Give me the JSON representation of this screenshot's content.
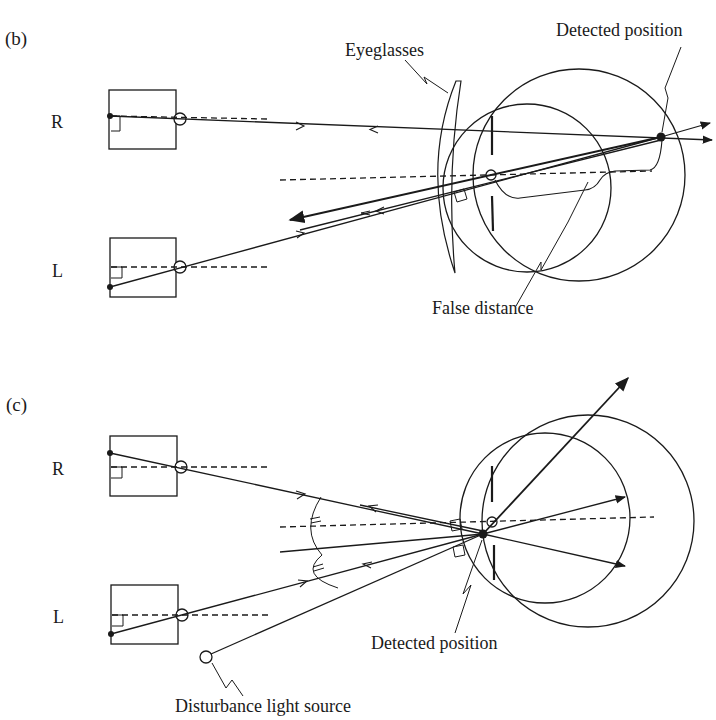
{
  "figure": {
    "panel_b": {
      "label": "(b)",
      "camera_right_label": "R",
      "camera_left_label": "L",
      "annotations": {
        "eyeglasses": "Eyeglasses",
        "detected_position": "Detected position",
        "false_distance": "False distance"
      }
    },
    "panel_c": {
      "label": "(c)",
      "camera_right_label": "R",
      "camera_left_label": "L",
      "annotations": {
        "detected_position": "Detected position",
        "disturbance_light_source": "Disturbance light source"
      }
    },
    "colors": {
      "line": "#1a1a1a",
      "background": "#ffffff"
    }
  }
}
